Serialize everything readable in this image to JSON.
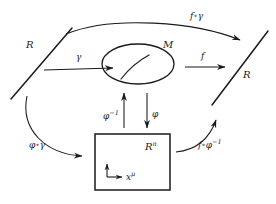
{
  "figure": {
    "kind": "commutative-diagram",
    "topic": "manifold-chart-diagram",
    "background_color": "#ffffff",
    "stroke_color": "#1a1a1a",
    "text_color": "#1a1a1a"
  },
  "shapes": {
    "manifold_ellipse": {
      "name": "M",
      "label": "M",
      "cx": 138,
      "cy": 63,
      "rx": 36,
      "ry": 20
    },
    "coordinate_rect": {
      "name": "Rn",
      "label": "R",
      "superscript": "n",
      "x": 95,
      "y": 134,
      "width": 75,
      "height": 56
    },
    "left_line": {
      "label": "R",
      "x1": 11,
      "y1": 98,
      "x2": 72,
      "y2": 28
    },
    "right_line": {
      "label": "R",
      "x1": 211,
      "y1": 104,
      "x2": 267,
      "y2": 32
    }
  },
  "labels": {
    "left_R": "R",
    "right_R": "R",
    "manifold_M": "M",
    "rn_base": "R",
    "rn_sup": "n",
    "gamma": "γ",
    "f": "f",
    "f_circ_gamma_f": "f",
    "f_circ_gamma_op": "∘",
    "f_circ_gamma_g": "γ",
    "phi": "φ",
    "phi_inv_base": "φ",
    "phi_inv_sup": "−1",
    "phi_circ_gamma_p": "φ",
    "phi_circ_gamma_op": "∘",
    "phi_circ_gamma_g": "γ",
    "f_circ_phi_inv_f": "f",
    "f_circ_phi_inv_op": "∘",
    "f_circ_phi_inv_p": "φ",
    "f_circ_phi_inv_sup": "−1",
    "x_mu_base": "x",
    "x_mu_sup": "μ"
  },
  "arrows": [
    {
      "name": "gamma-arrow",
      "label": "γ",
      "from": "R (left line)",
      "to": "M (manifold)",
      "style": "straight-horizontal"
    },
    {
      "name": "f-arrow",
      "label": "f",
      "from": "M (manifold)",
      "to": "R (right line)",
      "style": "straight-horizontal"
    },
    {
      "name": "f-compose-gamma-arrow",
      "label": "f∘γ",
      "from": "R (left line)",
      "to": "R (right line)",
      "style": "curved-over-top"
    },
    {
      "name": "phi-arrow",
      "label": "φ",
      "from": "M (manifold)",
      "to": "Rn (rectangle)",
      "style": "straight-vertical-down"
    },
    {
      "name": "phi-inverse-arrow",
      "label": "φ⁻¹",
      "from": "Rn (rectangle)",
      "to": "M (manifold)",
      "style": "straight-vertical-up"
    },
    {
      "name": "phi-compose-gamma-arrow",
      "label": "φ∘γ",
      "from": "R (left line)",
      "to": "Rn (rectangle)",
      "style": "curved-lower-left"
    },
    {
      "name": "f-compose-phi-inverse-arrow",
      "label": "f∘φ⁻¹",
      "from": "Rn (rectangle)",
      "to": "R (right line)",
      "style": "curved-lower-right"
    }
  ],
  "axes": {
    "name": "coordinate-axes",
    "label": "xμ",
    "origin_x": 108,
    "origin_y": 176
  }
}
